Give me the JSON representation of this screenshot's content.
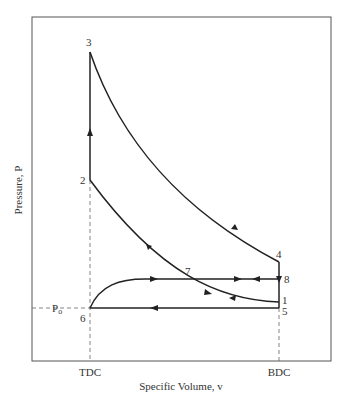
{
  "diagram": {
    "type": "pv-diagram",
    "title": "",
    "xlabel": "Specific Volume, v",
    "ylabel": "Pressure, P",
    "x_ticks": [
      {
        "label": "TDC",
        "x": 90
      },
      {
        "label": "BDC",
        "x": 279
      }
    ],
    "reference_pressure_label": "P",
    "reference_pressure_subscript": "o",
    "points": [
      {
        "id": "1",
        "label": "1",
        "x": 279,
        "y": 302
      },
      {
        "id": "2",
        "label": "2",
        "x": 90,
        "y": 180
      },
      {
        "id": "3",
        "label": "3",
        "x": 90,
        "y": 52
      },
      {
        "id": "4",
        "label": "4",
        "x": 279,
        "y": 262
      },
      {
        "id": "5",
        "label": "5",
        "x": 279,
        "y": 308
      },
      {
        "id": "6",
        "label": "6",
        "x": 90,
        "y": 308
      },
      {
        "id": "7",
        "label": "7",
        "x": 188,
        "y": 279
      },
      {
        "id": "8",
        "label": "8",
        "x": 279,
        "y": 279
      }
    ],
    "processes": [
      {
        "from": "1",
        "to": "2",
        "kind": "compression"
      },
      {
        "from": "2",
        "to": "3",
        "kind": "constant-volume heat addition"
      },
      {
        "from": "3",
        "to": "4",
        "kind": "expansion"
      },
      {
        "from": "4",
        "to": "8",
        "kind": "blowdown"
      },
      {
        "from": "8",
        "to": "7",
        "kind": "exhaust"
      },
      {
        "from": "7",
        "to": "8",
        "kind": "intake"
      },
      {
        "from": "6",
        "to": "7",
        "kind": "intake"
      },
      {
        "from": "5",
        "to": "6",
        "kind": "exhaust"
      }
    ],
    "colors": {
      "line": "#222222",
      "frame": "#555555",
      "dashed": "#666666",
      "text": "#333333"
    }
  }
}
